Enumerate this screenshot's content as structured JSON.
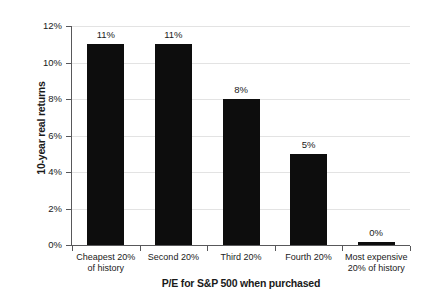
{
  "chart_data": {
    "type": "bar",
    "title": "",
    "xlabel": "P/E for S&P 500 when purchased",
    "ylabel": "10-year real returns",
    "categories": [
      "Cheapest 20%\nof history",
      "Second 20%",
      "Third 20%",
      "Fourth 20%",
      "Most expensive\n20% of history"
    ],
    "category_lines": [
      [
        "Cheapest 20%",
        "of history"
      ],
      [
        "Second 20%",
        ""
      ],
      [
        "Third 20%",
        ""
      ],
      [
        "Fourth 20%",
        ""
      ],
      [
        "Most expensive",
        "20% of history"
      ]
    ],
    "values": [
      11,
      11,
      8,
      5,
      0
    ],
    "value_labels": [
      "11%",
      "11%",
      "8%",
      "5%",
      "0%"
    ],
    "ylim": [
      0,
      12
    ],
    "yticks": [
      0,
      2,
      4,
      6,
      8,
      10,
      12
    ],
    "ytick_labels": [
      "0%",
      "2%",
      "4%",
      "6%",
      "8%",
      "10%",
      "12%"
    ],
    "grid": true,
    "legend": false,
    "bar_color": "#0d0d0d",
    "grid_color": "#e3e3e3",
    "axis_color": "#58585a",
    "background": "#ffffff"
  }
}
